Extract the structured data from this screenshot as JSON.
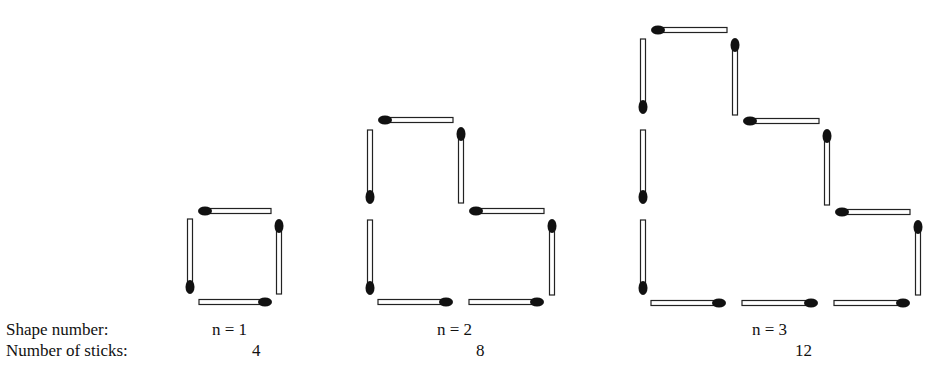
{
  "labels": {
    "shape_number": "Shape number:",
    "number_of_sticks": "Number of sticks:"
  },
  "shapes": [
    {
      "n_label": "n = 1",
      "sticks_count": "4",
      "sticks": [
        {
          "dir": "h",
          "x1": 205,
          "x2": 271,
          "y": 211,
          "head": "start"
        },
        {
          "dir": "v",
          "x": 279,
          "y1": 226,
          "y2": 294,
          "head": "start"
        },
        {
          "dir": "h",
          "x1": 199,
          "x2": 265,
          "y": 302,
          "head": "end"
        },
        {
          "dir": "v",
          "x": 190,
          "y1": 219,
          "y2": 287,
          "head": "end"
        }
      ]
    },
    {
      "n_label": "n = 2",
      "sticks_count": "8",
      "sticks": [
        {
          "dir": "h",
          "x1": 385,
          "x2": 453,
          "y": 120,
          "head": "start"
        },
        {
          "dir": "v",
          "x": 370,
          "y1": 130,
          "y2": 197,
          "head": "end"
        },
        {
          "dir": "v",
          "x": 461,
          "y1": 134,
          "y2": 203,
          "head": "start"
        },
        {
          "dir": "h",
          "x1": 476,
          "x2": 544,
          "y": 211,
          "head": "start"
        },
        {
          "dir": "v",
          "x": 370,
          "y1": 220,
          "y2": 288,
          "head": "end"
        },
        {
          "dir": "v",
          "x": 552,
          "y1": 226,
          "y2": 295,
          "head": "start"
        },
        {
          "dir": "h",
          "x1": 378,
          "x2": 446,
          "y": 302,
          "head": "end"
        },
        {
          "dir": "h",
          "x1": 469,
          "x2": 537,
          "y": 302,
          "head": "end"
        }
      ]
    },
    {
      "n_label": "n =  3",
      "sticks_count": "12",
      "sticks": [
        {
          "dir": "h",
          "x1": 658,
          "x2": 727,
          "y": 30,
          "head": "start"
        },
        {
          "dir": "v",
          "x": 643,
          "y1": 39,
          "y2": 107,
          "head": "end"
        },
        {
          "dir": "v",
          "x": 735,
          "y1": 45,
          "y2": 115,
          "head": "start"
        },
        {
          "dir": "h",
          "x1": 750,
          "x2": 819,
          "y": 121,
          "head": "start"
        },
        {
          "dir": "v",
          "x": 643,
          "y1": 130,
          "y2": 197,
          "head": "end"
        },
        {
          "dir": "v",
          "x": 827,
          "y1": 136,
          "y2": 205,
          "head": "start"
        },
        {
          "dir": "h",
          "x1": 842,
          "x2": 910,
          "y": 212,
          "head": "start"
        },
        {
          "dir": "v",
          "x": 643,
          "y1": 220,
          "y2": 288,
          "head": "end"
        },
        {
          "dir": "v",
          "x": 918,
          "y1": 227,
          "y2": 295,
          "head": "start"
        },
        {
          "dir": "h",
          "x1": 651,
          "x2": 719,
          "y": 303,
          "head": "end"
        },
        {
          "dir": "h",
          "x1": 742,
          "x2": 811,
          "y": 303,
          "head": "end"
        },
        {
          "dir": "h",
          "x1": 834,
          "x2": 903,
          "y": 303,
          "head": "end"
        }
      ]
    }
  ]
}
